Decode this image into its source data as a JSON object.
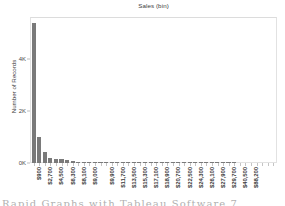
{
  "chart_data": {
    "type": "bar",
    "title": "Sales (bin)",
    "xlabel": "",
    "ylabel": "Number of Records",
    "ylim": [
      0,
      5600
    ],
    "yticks": [
      0,
      2000,
      4000
    ],
    "ytick_labels": [
      "0K",
      "2K",
      "4K"
    ],
    "grid": false,
    "legend": null,
    "bar_color": "#7a7a7a",
    "categories": [
      "$900",
      "$1,800",
      "$2,700",
      "$3,600",
      "$4,500",
      "$5,400",
      "$6,300",
      "$7,200",
      "$8,100",
      "$9,000",
      "$9,900",
      "$10,800",
      "$11,700",
      "$12,600",
      "$13,500",
      "$14,400",
      "$15,300",
      "$16,200",
      "$17,100",
      "$18,000",
      "$18,900",
      "$19,800",
      "$20,700",
      "$21,600",
      "$22,500",
      "$23,400",
      "$24,300",
      "$25,200",
      "$26,100",
      "$27,000",
      "$27,900",
      "$28,800",
      "$29,700",
      "$30,600",
      "$40,500",
      "$41,400",
      "$88,200"
    ],
    "visible_tick_labels": [
      "$900",
      "$2,700",
      "$4,500",
      "$6,300",
      "$8,100",
      "$9,000",
      "$9,900",
      "$11,700",
      "$13,500",
      "$15,300",
      "$17,100",
      "$18,900",
      "$20,700",
      "$22,500",
      "$24,300",
      "$26,100",
      "$27,900",
      "$29,700",
      "$40,500",
      "$88,200"
    ],
    "values": [
      5400,
      1000,
      430,
      200,
      150,
      145,
      120,
      70,
      45,
      38,
      30,
      26,
      22,
      20,
      18,
      15,
      14,
      12,
      11,
      10,
      9,
      8,
      8,
      7,
      6,
      6,
      5,
      5,
      4,
      4,
      4,
      3,
      3,
      3,
      2,
      2,
      2
    ]
  },
  "footer": {
    "caption": "Rapid Graphs with Tableau Software 7"
  }
}
